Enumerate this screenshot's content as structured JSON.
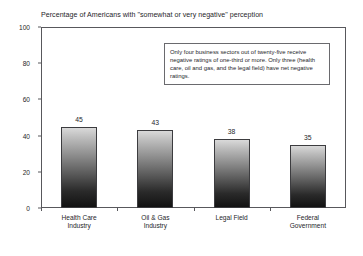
{
  "chart_data": {
    "type": "bar",
    "title": "Percentage of Americans with \"somewhat or very negative\" perception",
    "xlabel": "",
    "ylabel": "",
    "categories": [
      "Health Care Industry",
      "Oil & Gas Industry",
      "Legal Field",
      "Federal Government"
    ],
    "category_lines": [
      [
        "Health Care",
        "Industry"
      ],
      [
        "Oil & Gas",
        "Industry"
      ],
      [
        "Legal Field",
        ""
      ],
      [
        "Federal",
        "Government"
      ]
    ],
    "values": [
      45,
      43,
      38,
      35
    ],
    "value_labels": [
      "45",
      "43",
      "38",
      "35"
    ],
    "ylim": [
      0,
      100
    ],
    "yticks": [
      0,
      20,
      40,
      60,
      80,
      100
    ],
    "ytick_labels": [
      "0",
      "20",
      "40",
      "60",
      "80",
      "100"
    ],
    "grid": false,
    "legend": "none",
    "annotations": [
      {
        "text": "Only four business sectors out of twenty-five receive negative ratings of one-third or more. Only three (health care, oil and gas, and the legal field) have net negative ratings.",
        "position": "top-right-inside-plot"
      }
    ],
    "colors": {
      "bar_top": "#d9d9d9",
      "bar_bottom": "#121212",
      "bar_border": "#3c3c3f",
      "axis": "#58585c",
      "text": "#26262a",
      "background": "#ffffff"
    }
  }
}
